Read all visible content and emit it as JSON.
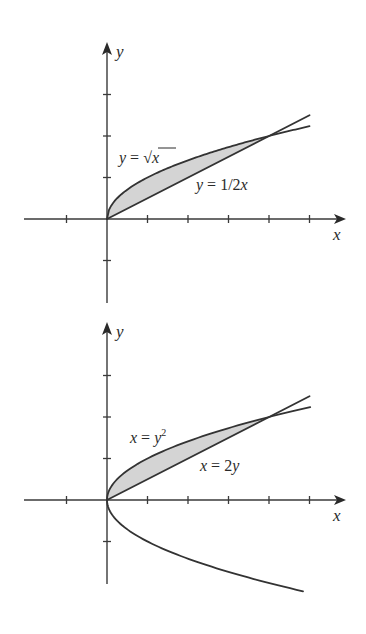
{
  "colors": {
    "ink": "#333333",
    "region_fill": "#d4d4d4",
    "background": "#ffffff"
  },
  "chart_data": [
    {
      "type": "line",
      "title": "",
      "xlabel": "x",
      "ylabel": "y",
      "xlim": [
        -2,
        5.5
      ],
      "ylim": [
        -2,
        3.5
      ],
      "x_ticks": [
        -1,
        1,
        2,
        3,
        4,
        5
      ],
      "y_ticks": [
        -1,
        1,
        2,
        3
      ],
      "tick_labels_shown": false,
      "grid": false,
      "shaded_region": {
        "between": [
          "y = sqrt(x)",
          "y = x/2"
        ],
        "x_range": [
          0,
          4
        ]
      },
      "intersection_points": [
        [
          0,
          0
        ],
        [
          4,
          2
        ]
      ],
      "series": [
        {
          "name": "y = √x",
          "label_parts": [
            "y",
            " = √",
            "x"
          ],
          "function": "sqrt",
          "x_range": [
            0,
            5
          ]
        },
        {
          "name": "y = 1/2x",
          "label_parts": [
            "y",
            " = 1/2",
            "x"
          ],
          "function": "half_x",
          "x_range": [
            0,
            5
          ]
        }
      ]
    },
    {
      "type": "line",
      "title": "",
      "xlabel": "x",
      "ylabel": "y",
      "xlim": [
        -2,
        5.5
      ],
      "ylim": [
        -2,
        3.5
      ],
      "x_ticks": [
        -1,
        1,
        2,
        3,
        4,
        5
      ],
      "y_ticks": [
        -1,
        1,
        2,
        3
      ],
      "tick_labels_shown": false,
      "grid": false,
      "shaded_region": {
        "between": [
          "x = y^2",
          "x = 2y"
        ],
        "y_range": [
          0,
          2
        ]
      },
      "intersection_points": [
        [
          0,
          0
        ],
        [
          4,
          2
        ]
      ],
      "series": [
        {
          "name": "x = y²",
          "label_parts": [
            "x",
            " = ",
            "y",
            "2"
          ],
          "function": "parabola_sideways",
          "y_range": [
            -2.2,
            2.24
          ]
        },
        {
          "name": "x = 2y",
          "label_parts": [
            "x",
            " = 2",
            "y"
          ],
          "function": "x_eq_2y",
          "x_range": [
            0,
            5
          ]
        }
      ]
    }
  ]
}
